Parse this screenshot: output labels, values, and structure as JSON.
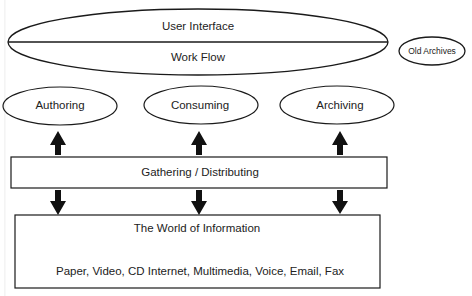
{
  "diagram": {
    "top_ellipse": {
      "upper_label": "User Interface",
      "lower_label": "Work Flow"
    },
    "side_ellipse": {
      "label": "Old Archives"
    },
    "activities": [
      {
        "label": "Authoring"
      },
      {
        "label": "Consuming"
      },
      {
        "label": "Archiving"
      }
    ],
    "middle_box": {
      "label": "Gathering / Distributing"
    },
    "bottom_box": {
      "title": "The World of Information",
      "media": "Paper, Video, CD Internet, Multimedia, Voice, Email, Fax"
    },
    "arrows": {
      "up": [
        "Gathering / Distributing -> Authoring",
        "Gathering / Distributing -> Consuming",
        "Gathering / Distributing -> Archiving"
      ],
      "down": [
        "Gathering / Distributing -> The World of Information (left)",
        "Gathering / Distributing -> The World of Information (center)",
        "Gathering / Distributing -> The World of Information (right)"
      ]
    },
    "colors": {
      "stroke": "#1a1a1a",
      "background": "#ffffff"
    }
  }
}
